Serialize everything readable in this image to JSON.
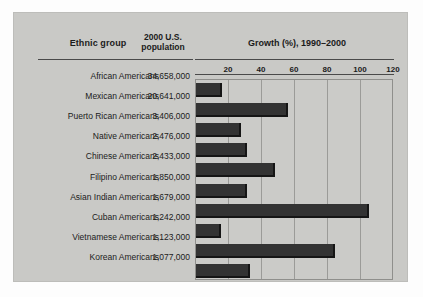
{
  "figure": {
    "panel_color": "#c9c9c6",
    "bar_color": "#333333",
    "plot_color": "#cbcbc8",
    "grid_color": "#9b9b98"
  },
  "headers": {
    "ethnic_group": "Ethnic group",
    "population_line1": "2000 U.S.",
    "population_line2": "population",
    "growth": "Growth (%), 1990–2000"
  },
  "chart_data": {
    "type": "bar",
    "orientation": "horizontal",
    "title": "Growth (%), 1990–2000",
    "xlabel": "Growth (%), 1990–2000",
    "ylabel": "Ethnic group",
    "xlim": [
      0,
      120
    ],
    "grid": true,
    "legend": false,
    "ticks": [
      20,
      40,
      60,
      80,
      100,
      120
    ],
    "tick_labels": [
      "20",
      "40",
      "60",
      "80",
      "100",
      "120"
    ],
    "categories": [
      "African Americans",
      "Mexican Americans",
      "Puerto Rican Americans",
      "Native Americans",
      "Chinese Americans",
      "Filipino Americans",
      "Asian Indian Americans",
      "Cuban Americans",
      "Vietnamese Americans",
      "Korean Americans"
    ],
    "values": [
      16,
      56,
      27,
      31,
      48,
      31,
      105,
      15,
      84,
      33
    ],
    "population_labels": [
      "34,658,000",
      "20,641,000",
      "3,406,000",
      "2,476,000",
      "2,433,000",
      "1,850,000",
      "1,679,000",
      "1,242,000",
      "1,123,000",
      "1,077,000"
    ],
    "population_values": [
      34658000,
      20641000,
      3406000,
      2476000,
      2433000,
      1850000,
      1679000,
      1242000,
      1123000,
      1077000
    ]
  }
}
